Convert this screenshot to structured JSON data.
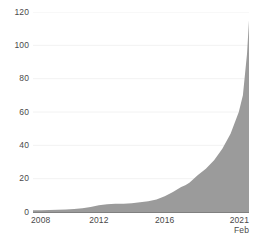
{
  "chart_data": {
    "type": "area",
    "title": "",
    "subtitle": "",
    "xlabel": "",
    "ylabel": "",
    "ylim": [
      0,
      120
    ],
    "xlim": [
      2008,
      2021.12
    ],
    "grid": true,
    "legend": false,
    "fill_color": "#9b9b9b",
    "axis_color": "#808080",
    "gridline_color": "#f2f2f2",
    "label_color": "#4a4a4a",
    "y_ticks": [
      0,
      20,
      40,
      60,
      80,
      100,
      120
    ],
    "y_tick_labels": [
      "0",
      "20",
      "40",
      "60",
      "80",
      "100",
      "120"
    ],
    "x_ticks": [
      2008,
      2012,
      2016,
      2021
    ],
    "x_tick_labels": [
      "2008",
      "2012",
      "2016",
      "2021"
    ],
    "x_tick_sublabels": [
      "",
      "",
      "",
      "Feb"
    ],
    "series": [
      {
        "name": "value",
        "x": [
          2008,
          2008.5,
          2009,
          2009.5,
          2010,
          2010.5,
          2011,
          2011.5,
          2012,
          2012.5,
          2013,
          2013.5,
          2014,
          2014.5,
          2015,
          2015.5,
          2016,
          2016.5,
          2017,
          2017.25,
          2017.5,
          2018,
          2018.5,
          2019,
          2019.5,
          2020,
          2020.5,
          2020.75,
          2021,
          2021.12
        ],
        "values": [
          1,
          1,
          1.2,
          1.3,
          1.5,
          1.8,
          2.2,
          3,
          4,
          4.6,
          5,
          5,
          5.2,
          5.8,
          6.5,
          7.5,
          9.5,
          12,
          15,
          16,
          17.5,
          22,
          26,
          31,
          38,
          47,
          60,
          70,
          95,
          115
        ]
      }
    ]
  }
}
